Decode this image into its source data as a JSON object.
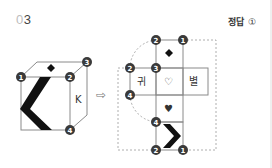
{
  "question": {
    "number_prefix": "0",
    "number_suffix": "3"
  },
  "answer": {
    "label": "정답",
    "mark": "①"
  },
  "cube": {
    "front_face_symbol": "chevron-left",
    "top_face_symbol": "◆",
    "right_face_letter": "K",
    "vertex_labels": {
      "front_top_left": "1",
      "front_top_right": "2",
      "back_top_right": "3",
      "front_bottom_right": "4"
    }
  },
  "arrow": "⇨",
  "net": {
    "faces": {
      "top": "◆",
      "middle_left": "귀",
      "middle_center": "♡",
      "middle_right": "별",
      "below": "♥",
      "bottom": "chevron-right"
    },
    "vertex_labels": {
      "top_left": "2",
      "top_right": "1",
      "middle_top_left": "2",
      "middle_top_center": "3",
      "middle_bottom_left": "4",
      "bottom_top_left": "4",
      "bottom_left": "2",
      "bottom_right": "1"
    }
  },
  "colors": {
    "line": "#8a8a8a",
    "badge": "#3a3a3a",
    "dash": "#9a9a9a"
  }
}
